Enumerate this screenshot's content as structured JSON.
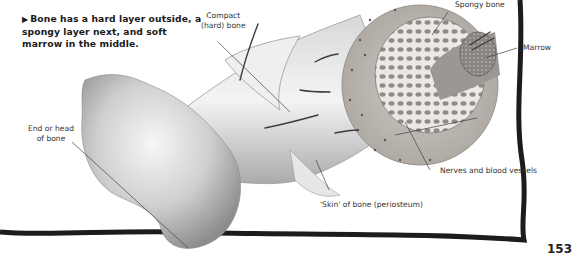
{
  "caption": {
    "arrow": "▶",
    "text": "Bone has a hard layer outside, a spongy layer next, and soft marrow in the middle."
  },
  "labels": {
    "compact_line1": "Compact",
    "compact_line2": "(hard) bone",
    "spongy": "Spongy bone",
    "marrow": "Marrow",
    "end_line1": "End or head",
    "end_line2": "of bone",
    "nerves": "Nerves and blood vessels",
    "periosteum": "'Skin' of bone (periosteum)"
  },
  "page_number": "153",
  "colors": {
    "border": "#1c1c1c",
    "leader_line": "#444444",
    "bone_light": "#f2f2f2",
    "bone_mid": "#bdbdbd",
    "bone_dark": "#7a7a7a",
    "compact_ring": "#b8b4ae",
    "spongy": "#d9d6d2"
  }
}
